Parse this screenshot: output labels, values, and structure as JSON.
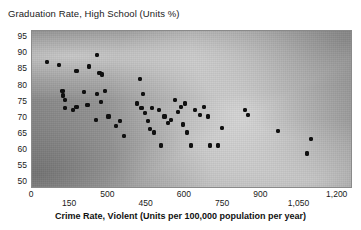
{
  "chart_data": {
    "type": "scatter",
    "title": "Graduation Rate, High School (Units %)",
    "xlabel": "Crime Rate, Violent (Units per 100,000 population per year)",
    "ylabel": "Graduation Rate, High School (Units %)",
    "xlim": [
      0,
      1260
    ],
    "ylim": [
      48,
      97
    ],
    "grid": false,
    "legend": null,
    "background": "grayscale-gradient",
    "marker_color": "#101010",
    "frame_color": "#8a8a8a",
    "y_ticks": [
      95,
      90,
      85,
      80,
      75,
      70,
      65,
      60,
      55,
      50
    ],
    "x_ticks": [
      {
        "label": "0",
        "value": 0,
        "row": "top"
      },
      {
        "label": "150",
        "value": 150,
        "row": "bottom"
      },
      {
        "label": "500",
        "value": 300,
        "row": "top"
      },
      {
        "label": "450",
        "value": 450,
        "row": "bottom"
      },
      {
        "label": "600",
        "value": 600,
        "row": "top"
      },
      {
        "label": "750",
        "value": 750,
        "row": "bottom"
      },
      {
        "label": "900",
        "value": 900,
        "row": "top"
      },
      {
        "label": "1,050",
        "value": 1050,
        "row": "bottom"
      },
      {
        "label": "1,200",
        "value": 1200,
        "row": "top"
      }
    ],
    "points": [
      {
        "x": 60,
        "y": 87.5
      },
      {
        "x": 105,
        "y": 86.5
      },
      {
        "x": 175,
        "y": 84.5
      },
      {
        "x": 225,
        "y": 86.0
      },
      {
        "x": 255,
        "y": 89.5
      },
      {
        "x": 265,
        "y": 84.0
      },
      {
        "x": 275,
        "y": 83.5
      },
      {
        "x": 120,
        "y": 78.5
      },
      {
        "x": 122,
        "y": 77.0
      },
      {
        "x": 128,
        "y": 75.5
      },
      {
        "x": 130,
        "y": 73.0
      },
      {
        "x": 160,
        "y": 72.5
      },
      {
        "x": 175,
        "y": 73.5
      },
      {
        "x": 205,
        "y": 78.0
      },
      {
        "x": 218,
        "y": 74.0
      },
      {
        "x": 250,
        "y": 69.5
      },
      {
        "x": 255,
        "y": 77.5
      },
      {
        "x": 270,
        "y": 75.0
      },
      {
        "x": 285,
        "y": 78.5
      },
      {
        "x": 300,
        "y": 70.5
      },
      {
        "x": 330,
        "y": 67.5
      },
      {
        "x": 345,
        "y": 69.0
      },
      {
        "x": 360,
        "y": 64.5
      },
      {
        "x": 425,
        "y": 82.0
      },
      {
        "x": 412,
        "y": 74.5
      },
      {
        "x": 430,
        "y": 73.0
      },
      {
        "x": 437,
        "y": 77.5
      },
      {
        "x": 445,
        "y": 71.5
      },
      {
        "x": 455,
        "y": 69.0
      },
      {
        "x": 462,
        "y": 66.5
      },
      {
        "x": 470,
        "y": 73.0
      },
      {
        "x": 480,
        "y": 65.5
      },
      {
        "x": 498,
        "y": 72.5
      },
      {
        "x": 505,
        "y": 61.5
      },
      {
        "x": 520,
        "y": 70.5
      },
      {
        "x": 535,
        "y": 68.5
      },
      {
        "x": 545,
        "y": 69.5
      },
      {
        "x": 560,
        "y": 75.5
      },
      {
        "x": 572,
        "y": 72.0
      },
      {
        "x": 585,
        "y": 73.5
      },
      {
        "x": 592,
        "y": 68.0
      },
      {
        "x": 600,
        "y": 74.5
      },
      {
        "x": 610,
        "y": 65.5
      },
      {
        "x": 625,
        "y": 61.5
      },
      {
        "x": 640,
        "y": 72.5
      },
      {
        "x": 660,
        "y": 71.0
      },
      {
        "x": 675,
        "y": 73.5
      },
      {
        "x": 690,
        "y": 70.5
      },
      {
        "x": 700,
        "y": 61.5
      },
      {
        "x": 730,
        "y": 61.5
      },
      {
        "x": 745,
        "y": 67.0
      },
      {
        "x": 835,
        "y": 72.5
      },
      {
        "x": 848,
        "y": 71.0
      },
      {
        "x": 965,
        "y": 66.0
      },
      {
        "x": 1095,
        "y": 63.5
      },
      {
        "x": 1080,
        "y": 59.0
      }
    ]
  }
}
